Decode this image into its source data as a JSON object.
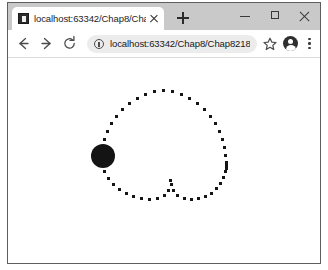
{
  "window": {
    "controls": {
      "minimize_label": "Minimize",
      "maximize_label": "Maximize",
      "close_label": "Close"
    }
  },
  "tab_strip": {
    "tabs": [
      {
        "title": "localhost:63342/Chap8/Chap8",
        "favicon": "intellij-favicon",
        "close_label": "Close tab",
        "active": true
      }
    ],
    "new_tab_label": "New tab"
  },
  "toolbar": {
    "back_label": "Back",
    "forward_label": "Forward",
    "reload_label": "Reload",
    "site_info_label": "View site information",
    "url": "localhost:63342/Chap8/Chap8218.h...",
    "url_placeholder": "Search Google or type a URL",
    "bookmark_label": "Bookmark this tab",
    "profile_label": "Profile",
    "menu_label": "Customize and control Google Chrome"
  },
  "page": {
    "canvas": {
      "name": "heart-animation-canvas",
      "background": "#ffffff",
      "dot_color": "#151515",
      "ball_color": "#141414",
      "ball": {
        "cx": 102,
        "cy": 155,
        "r": 12
      },
      "dots": [
        [
          161,
          88
        ],
        [
          152,
          89
        ],
        [
          170,
          89
        ],
        [
          143,
          92
        ],
        [
          179,
          92
        ],
        [
          135,
          96
        ],
        [
          187,
          96
        ],
        [
          127,
          101
        ],
        [
          195,
          101
        ],
        [
          120,
          107
        ],
        [
          202,
          107
        ],
        [
          114,
          114
        ],
        [
          208,
          114
        ],
        [
          109,
          121
        ],
        [
          213,
          121
        ],
        [
          105,
          129
        ],
        [
          217,
          129
        ],
        [
          102,
          137
        ],
        [
          220,
          137
        ],
        [
          100,
          145
        ],
        [
          222,
          145
        ],
        [
          99,
          153
        ],
        [
          223,
          153
        ],
        [
          100,
          161
        ],
        [
          224,
          160
        ],
        [
          224,
          163
        ],
        [
          224,
          166
        ],
        [
          223,
          169
        ],
        [
          102,
          169
        ],
        [
          106,
          176
        ],
        [
          221,
          175
        ],
        [
          111,
          182
        ],
        [
          218,
          181
        ],
        [
          117,
          187
        ],
        [
          214,
          186
        ],
        [
          124,
          191
        ],
        [
          209,
          191
        ],
        [
          131,
          194
        ],
        [
          203,
          194
        ],
        [
          139,
          196
        ],
        [
          196,
          196
        ],
        [
          147,
          197
        ],
        [
          189,
          197
        ],
        [
          155,
          196
        ],
        [
          182,
          196
        ],
        [
          162,
          193
        ],
        [
          175,
          193
        ],
        [
          166,
          188
        ],
        [
          171,
          188
        ],
        [
          169,
          182
        ],
        [
          168,
          178
        ]
      ]
    }
  }
}
